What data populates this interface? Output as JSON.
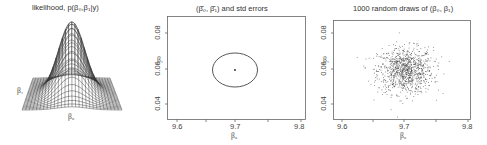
{
  "figure": {
    "panels": [
      {
        "title": "likelihood, p(β₀,β₁|y)",
        "x_label": "β₀",
        "y_label": "β₁"
      },
      {
        "title_prefix": "(",
        "title_b0": "β̂₀",
        "title_sep": ", ",
        "title_b1": "β̂₁",
        "title_suffix": ") and std errors",
        "x_label": "β₀",
        "y_label": "β₁",
        "x_ticks": [
          "9.6",
          "9.7",
          "9.8"
        ],
        "y_ticks": [
          "0.04",
          "0.06",
          "0.08"
        ]
      },
      {
        "title": "1000 random draws of (β₀, β₁)",
        "x_label": "β₀",
        "y_label": "β₁",
        "x_ticks": [
          "9.6",
          "9.7",
          "9.8"
        ],
        "y_ticks": [
          "0.04",
          "0.06",
          "0.08"
        ]
      }
    ]
  },
  "chart_data": [
    {
      "type": "surface",
      "title": "likelihood, p(β0,β1|y)",
      "xlabel": "β0",
      "ylabel": "β1",
      "description": "3D wireframe of a bivariate normal likelihood, single peak centered"
    },
    {
      "type": "scatter",
      "title": "(β̂0, β̂1) and std errors",
      "xlabel": "β0",
      "ylabel": "β1",
      "xlim": [
        9.58,
        9.81
      ],
      "ylim": [
        0.03,
        0.09
      ],
      "x_ticks": [
        9.6,
        9.7,
        9.8
      ],
      "y_ticks": [
        0.04,
        0.06,
        0.08
      ],
      "point_estimate": {
        "beta0": 9.7,
        "beta1": 0.059
      },
      "ellipse": {
        "center": [
          9.7,
          0.059
        ],
        "half_width_beta0": 0.038,
        "half_height_beta1": 0.0095
      }
    },
    {
      "type": "scatter",
      "title": "1000 random draws of (β0, β1)",
      "xlabel": "β0",
      "ylabel": "β1",
      "xlim": [
        9.58,
        9.81
      ],
      "ylim": [
        0.03,
        0.09
      ],
      "x_ticks": [
        9.6,
        9.7,
        9.8
      ],
      "y_ticks": [
        0.04,
        0.06,
        0.08
      ],
      "n_points": 1000,
      "center": [
        9.7,
        0.059
      ],
      "sd_beta0": 0.022,
      "sd_beta1": 0.0065
    }
  ]
}
